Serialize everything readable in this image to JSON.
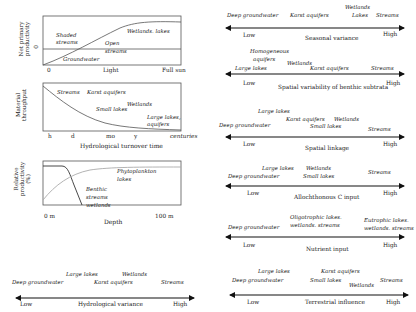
{
  "panels": {
    "light": {
      "ylabel_line1": "Net primary",
      "ylabel_line2": "productivity",
      "ylabel_zero": "0",
      "x_ticks": [
        "0",
        "Light",
        "Full sun"
      ],
      "labels": {
        "shaded": "Shaded",
        "shaded2": "streams",
        "open": "Open",
        "open2": "streams",
        "wetlands_lakes": "Wetlands. lakes",
        "groundwater": "Groundwater"
      }
    },
    "turnover": {
      "ylabel_line1": "Material",
      "ylabel_line2": "throughput",
      "x_ticks": [
        "h",
        "d",
        "mo",
        "y",
        "centuries"
      ],
      "xlabel": "Hydrological turnover time",
      "labels": {
        "streams": "Streams",
        "karst": "Karst aquifers",
        "wetlands": "Wetlands",
        "small_lakes": "Small lakes",
        "large_lakes": "Large lakes,",
        "aquifers": "aquifers"
      }
    },
    "depth": {
      "ylabel_line1": "Relative",
      "ylabel_line2": "productivity",
      "ylabel_line3": "(%)",
      "x_ticks": [
        "0 m",
        "100 m"
      ],
      "xlabel": "Depth",
      "labels": {
        "phyto": "Phytoplankton",
        "phyto2": "lakes",
        "benthic": "Benthic",
        "benthic2": "streams",
        "benthic3": "wetlands"
      }
    }
  },
  "gradients": [
    {
      "id": "hydrological-variance",
      "title": "Hydrological variance",
      "low": "Low",
      "high": "High",
      "items": [
        "Deep groundwater",
        "Large lakes",
        "Karst aquifers",
        "Wetlands",
        "Streams"
      ]
    },
    {
      "id": "seasonal-variance",
      "title": "Seasonal variance",
      "low": "Low",
      "high": "High",
      "items": [
        "Deep groundwater",
        "Karst aquifers",
        "Wetlands",
        "Lakes",
        "Streams"
      ]
    },
    {
      "id": "spatial-variability",
      "title": "Spatial variability of benthic subtrata",
      "low": "Low",
      "high": "High",
      "items": [
        "Homogeneous",
        "aquifers",
        "Large lakes",
        "Wetlands",
        "Karst aquifers",
        "Streams"
      ]
    },
    {
      "id": "spatial-linkage",
      "title": "Spatial linkage",
      "low": "Low",
      "high": "High",
      "items": [
        "Large lakes",
        "Deep groundwater",
        "Karst aquifers",
        "Wetlands",
        "Small lakes",
        "Streams"
      ]
    },
    {
      "id": "allochthonous",
      "title": "Allochthonous C input",
      "low": "Low",
      "high": "High",
      "items": [
        "Large lakes",
        "Deep groundwater",
        "Wetlands",
        "Small lakes",
        "Streams"
      ]
    },
    {
      "id": "nutrient",
      "title": "Nutrient input",
      "low": "Low",
      "high": "High",
      "items": [
        "Oligotrophic lakes.",
        "wetlands. streams",
        "Deep groundwater",
        "Eutrophic lakes.",
        "wetlands. streams"
      ]
    },
    {
      "id": "terrestrial",
      "title": "Terrestrial influence",
      "low": "Low",
      "high": "High",
      "items": [
        "Large lakes",
        "Karst aquifers",
        "Deep groundwater",
        "Small lakes",
        "Wetlands",
        "Streams"
      ]
    }
  ]
}
